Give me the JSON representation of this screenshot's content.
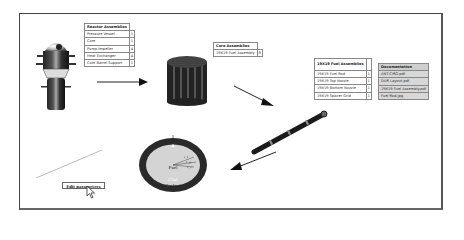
{
  "reactor_assemblies": {
    "header": "Reactor Assemblies",
    "rows": [
      {
        "label": "Pressure Vessel",
        "count": "1"
      },
      {
        "label": "Core",
        "count": "1"
      },
      {
        "label": "Pump Impeller",
        "count": "4"
      },
      {
        "label": "Heat Exchanger",
        "count": "4"
      },
      {
        "label": "Core Barrel Support",
        "count": "1"
      }
    ]
  },
  "core_assemblies": {
    "header": "Core Assemblies",
    "rows": [
      {
        "label": "19X19 Fuel Assembly",
        "count": "8"
      }
    ]
  },
  "fuel_assemblies": {
    "header": "19X19 Fuel Assemblies",
    "rows": [
      {
        "label": "19X19 Fuel Rod",
        "count": "1"
      },
      {
        "label": "19X19 Top Nozzle",
        "count": "1"
      },
      {
        "label": "19X19 Bottom Nozzle",
        "count": "1"
      },
      {
        "label": "19X19 Spacer Grid",
        "count": "1"
      }
    ]
  },
  "documentation": {
    "header": "Documentation",
    "rows": [
      {
        "label": "ANT-CIRO.pdf"
      },
      {
        "label": "DUR Layout.pdf"
      },
      {
        "label": "19X19 Fuel Assembly.pdf"
      },
      {
        "label": "Fuel Rod.jpg"
      }
    ]
  },
  "cross_section": {
    "labels": [
      "Fuel",
      "Gap",
      "Clad",
      "Coolant"
    ],
    "radii": [
      "r_f",
      "r_g",
      "r_c"
    ]
  },
  "edit_button": {
    "label": "Edit parameters"
  },
  "colors": {
    "frame": "#444444",
    "doc_bg": "#d8d8d8",
    "clad": "#2a2a2a",
    "fuel": "#d4d4d4"
  }
}
